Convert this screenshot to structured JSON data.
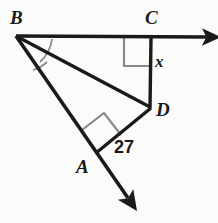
{
  "figure": {
    "type": "geometry-diagram",
    "background_color": "#fbfbfa",
    "stroke_color": "#1a1a1a",
    "mark_color": "#8a8a8a",
    "vertices": [
      {
        "name": "B",
        "label": "B",
        "x": 16,
        "y": 36
      },
      {
        "name": "C",
        "label": "C",
        "x": 152,
        "y": 38
      },
      {
        "name": "D",
        "label": "D",
        "x": 150,
        "y": 107
      },
      {
        "name": "A",
        "label": "A",
        "x": 97,
        "y": 152
      }
    ],
    "measures": [
      {
        "name": "segment-cd",
        "label": "x",
        "kind": "variable"
      },
      {
        "name": "segment-ad",
        "label": "27",
        "kind": "length"
      }
    ],
    "angle_marks": [
      {
        "name": "angle-arc-dbc",
        "vertex": "B",
        "kind": "arc"
      },
      {
        "name": "angle-arc-abd",
        "vertex": "B",
        "kind": "arc"
      },
      {
        "name": "right-angle-c",
        "vertex": "C",
        "kind": "square"
      },
      {
        "name": "right-angle-a",
        "vertex": "A",
        "kind": "square"
      }
    ],
    "rays": [
      {
        "name": "ray-bc",
        "from": "B",
        "through": "C",
        "arrow_at": {
          "x": 212,
          "y": 37
        }
      },
      {
        "name": "ray-ba",
        "from": "B",
        "through": "A",
        "arrow_at": {
          "x": 133,
          "y": 205
        }
      }
    ],
    "segments": [
      {
        "name": "segment-bd",
        "from": "B",
        "to": "D"
      },
      {
        "name": "segment-cd",
        "from": "C",
        "to": "D"
      },
      {
        "name": "segment-ad",
        "from": "A",
        "to": "D"
      }
    ]
  }
}
